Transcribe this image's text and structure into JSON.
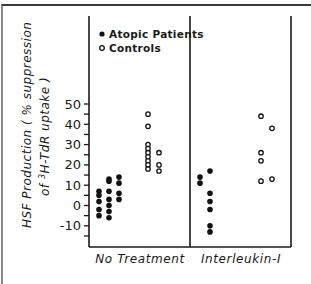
{
  "chart_data": {
    "type": "scatter",
    "title": "",
    "ylabel_line1": "HSF Production ( % suppression",
    "ylabel_line2_prefix": "of ",
    "ylabel_line2_sup": "3",
    "ylabel_line2_rest": "H-TdR uptake )",
    "xlabel": "",
    "ylim": [
      -16,
      70
    ],
    "yticks": [
      50,
      40,
      30,
      20,
      10,
      0,
      -10
    ],
    "ytick_labels": [
      "50",
      "40",
      "30",
      "20",
      "10",
      "0",
      "-10"
    ],
    "minor_tick_step": 5,
    "grid": false,
    "categories": [
      "No Treatment",
      "Interleukin-I"
    ],
    "legend": {
      "position": "upper-left",
      "entries": [
        {
          "label": "Atopic Patients",
          "marker": "filled-circle"
        },
        {
          "label": "Controls",
          "marker": "open-circle"
        }
      ]
    },
    "series": [
      {
        "name": "Atopic Patients",
        "marker": "filled-circle",
        "groups": [
          {
            "category": "No Treatment",
            "column": 1,
            "values": [
              7,
              5,
              2,
              -2,
              -5
            ]
          },
          {
            "category": "No Treatment",
            "column": 2,
            "values": [
              13,
              12,
              7,
              3,
              0,
              -3,
              -6
            ]
          },
          {
            "category": "No Treatment",
            "column": 3,
            "values": [
              14,
              11,
              6,
              3
            ]
          },
          {
            "category": "Interleukin-I",
            "column": 1,
            "values": [
              14,
              11
            ]
          },
          {
            "category": "Interleukin-I",
            "column": 2,
            "values": [
              17,
              6,
              2,
              -2,
              -10,
              -13
            ]
          }
        ]
      },
      {
        "name": "Controls",
        "marker": "open-circle",
        "groups": [
          {
            "category": "No Treatment",
            "column": 1,
            "values": [
              45,
              39,
              30,
              28,
              26,
              24,
              22,
              20,
              18
            ]
          },
          {
            "category": "No Treatment",
            "column": 2,
            "values": [
              26,
              20,
              17
            ]
          },
          {
            "category": "Interleukin-I",
            "column": 1,
            "values": [
              44,
              26,
              22,
              12
            ]
          },
          {
            "category": "Interleukin-I",
            "column": 2,
            "values": [
              38,
              13
            ]
          }
        ]
      }
    ]
  },
  "layout": {
    "axis_left_x": 89,
    "axis_top_y": 16,
    "axis_bottom_y": 247,
    "axis_right_x": 291,
    "divider_x": 190,
    "y_zero_px": 205.5,
    "px_per_unit": 2.03,
    "column_x": {
      "Atopic Patients": {
        "No Treatment": [
          99,
          109,
          119
        ],
        "Interleukin-I": [
          200,
          210
        ]
      },
      "Controls": {
        "No Treatment": [
          148,
          159
        ],
        "Interleukin-I": [
          261,
          272
        ]
      }
    },
    "category_label_x": [
      140,
      241
    ],
    "category_label_y": 263
  }
}
